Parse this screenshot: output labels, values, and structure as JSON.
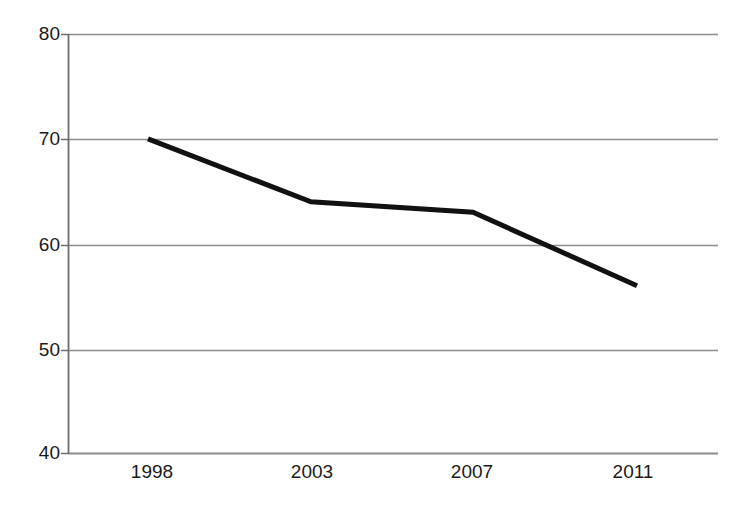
{
  "chart_data": {
    "type": "line",
    "title": "",
    "subtitle": "",
    "xlabel": "",
    "ylabel": "",
    "categories": [
      "1998",
      "2003",
      "2007",
      "2011"
    ],
    "x": [
      1998,
      2003,
      2007,
      2011
    ],
    "values": [
      70,
      64,
      63,
      56
    ],
    "series": [
      {
        "name": "",
        "values": [
          70,
          64,
          63,
          56
        ]
      }
    ],
    "ylim": [
      40,
      80
    ],
    "y_ticks": [
      80,
      70,
      60,
      50,
      40
    ],
    "y_tick_labels": [
      "80",
      "70",
      "60",
      "50",
      "40"
    ],
    "x_tick_labels": [
      "1998",
      "2003",
      "2007",
      "2011"
    ],
    "grid": true,
    "grid_axis": "y",
    "legend": false,
    "legend_position": "none",
    "annotations": [],
    "colors": {
      "line": "#111111",
      "grid": "#8c8c8c",
      "axis": "#6e6e6e",
      "text": "#1a1a1a",
      "background": "#ffffff"
    },
    "line_width_px": 5
  },
  "axes": {
    "y_labels": [
      {
        "text": "80",
        "top": 24
      },
      {
        "text": "70",
        "top": 129
      },
      {
        "text": "60",
        "top": 235
      },
      {
        "text": "50",
        "top": 340
      },
      {
        "text": "40",
        "top": 443
      }
    ],
    "x_labels": [
      {
        "text": "1998",
        "left": 107
      },
      {
        "text": "2003",
        "left": 267
      },
      {
        "text": "2007",
        "left": 427
      },
      {
        "text": "2011",
        "left": 588
      }
    ]
  }
}
